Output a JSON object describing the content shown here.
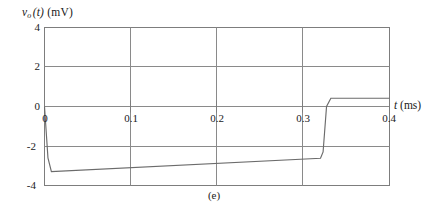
{
  "figure": {
    "caption": "(e)",
    "y_axis_label_var": "v",
    "y_axis_label_sub": "o",
    "y_axis_label_arg": "(t)",
    "y_axis_label_unit": "(mV)",
    "x_axis_label_var": "t",
    "x_axis_label_unit": "(ms)"
  },
  "chart_data": {
    "type": "line",
    "title": "",
    "subtitle": "(e)",
    "xlabel": "t (ms)",
    "ylabel": "v_o(t) (mV)",
    "xlim": [
      0,
      0.4
    ],
    "ylim": [
      -4,
      4
    ],
    "xticks": [
      0,
      0.1,
      0.2,
      0.3,
      0.4
    ],
    "xtick_labels": [
      "0",
      "0.1",
      "0.2",
      "0.3",
      "0.4"
    ],
    "yticks": [
      -4,
      -2,
      0,
      2,
      4
    ],
    "ytick_labels": [
      "-4",
      "-2",
      "0",
      "2",
      "4"
    ],
    "grid": true,
    "grid_axis": "both",
    "legend": null,
    "origin_label": "0",
    "series": [
      {
        "name": "v_o(t)",
        "color": "#6b6b6b",
        "x": [
          0.0,
          0.004,
          0.008,
          0.32,
          0.323,
          0.327,
          0.332,
          0.4
        ],
        "y": [
          0.0,
          -2.6,
          -3.3,
          -2.62,
          -2.3,
          0.0,
          0.42,
          0.42
        ]
      }
    ],
    "annotations": [
      {
        "text": "step transition",
        "x": 0.327,
        "y": 0.0
      }
    ]
  },
  "colors": {
    "axis": "#7d7d7d",
    "grid": "#8a8a8a",
    "curve": "#6e6e6e",
    "text": "#1a1a1a",
    "background": "#ffffff"
  }
}
